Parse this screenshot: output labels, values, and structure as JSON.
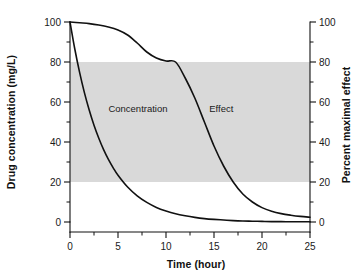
{
  "chart_data": {
    "type": "line",
    "title": "",
    "xlabel": "Time (hour)",
    "ylabel": "Drug concentration (mg/L)",
    "y2label": "Percent maximal effect",
    "xlim": [
      0,
      25
    ],
    "ylim": [
      0,
      100
    ],
    "y2lim": [
      0,
      100
    ],
    "x_ticks": [
      0,
      5,
      10,
      15,
      20,
      25
    ],
    "x_tick_labels": [
      "0",
      "5",
      "10",
      "15",
      "20",
      "25"
    ],
    "x_minor_step": 2.5,
    "y_ticks": [
      0,
      20,
      40,
      60,
      80,
      100
    ],
    "y_tick_labels": [
      "0",
      "20",
      "40",
      "60",
      "80",
      "100"
    ],
    "y_minor_step": 10,
    "y2_ticks": [
      0,
      20,
      40,
      60,
      80,
      100
    ],
    "y2_tick_labels": [
      "0",
      "20",
      "40",
      "60",
      "80",
      "100"
    ],
    "y2_minor_step": 10,
    "grid": false,
    "legend_position": "inline-annotations",
    "band": {
      "label": "therapeutic-effect-band",
      "y_from": 20,
      "y_to": 80,
      "axis": "right",
      "color": "#d9d9d9"
    },
    "annotations": [
      {
        "text": "Concentration",
        "x": 4.0,
        "y": 55
      },
      {
        "text": "Effect",
        "x": 14.5,
        "y": 55
      }
    ],
    "series": [
      {
        "name": "Concentration",
        "axis": "left",
        "units": "mg/L",
        "x": [
          0,
          0.5,
          1,
          1.5,
          2,
          2.5,
          3,
          3.5,
          4,
          4.5,
          5,
          6,
          7,
          8,
          9,
          10,
          11,
          12,
          13,
          14,
          15,
          16,
          17,
          18,
          19,
          20,
          21,
          22,
          23,
          24,
          25
        ],
        "values": [
          100,
          86.5,
          74.8,
          64.7,
          56.0,
          48.4,
          41.9,
          36.2,
          31.3,
          27.1,
          23.4,
          17.5,
          13.1,
          9.8,
          7.3,
          5.5,
          4.1,
          3.1,
          2.3,
          1.7,
          1.3,
          1.0,
          0.7,
          0.5,
          0.4,
          0.3,
          0.2,
          0.2,
          0.1,
          0.1,
          0.1
        ]
      },
      {
        "name": "Effect",
        "axis": "right",
        "units": "percent",
        "x": [
          0,
          1,
          2,
          3,
          4,
          5,
          6,
          7,
          8,
          9,
          10,
          11,
          12,
          13,
          14,
          15,
          16,
          17,
          18,
          19,
          20,
          21,
          22,
          23,
          24,
          25
        ],
        "values": [
          100,
          99.6,
          99.2,
          98.5,
          97.5,
          96.0,
          93.5,
          89.5,
          85.0,
          82.0,
          80.5,
          80.0,
          72.0,
          62.0,
          50.0,
          38.0,
          28.0,
          20.0,
          14.0,
          10.0,
          7.2,
          5.4,
          4.2,
          3.4,
          2.8,
          2.4
        ]
      }
    ]
  },
  "labels": {
    "x_axis_title": "Time (hour)",
    "y_axis_title": "Drug concentration (mg/L)",
    "y2_axis_title": "Percent maximal effect",
    "concentration_label": "Concentration",
    "effect_label": "Effect"
  }
}
